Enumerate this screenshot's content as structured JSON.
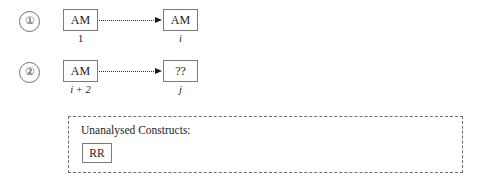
{
  "diagram": {
    "rows": [
      {
        "marker": "①",
        "source": {
          "text": "AM",
          "label": "1"
        },
        "target": {
          "text": "AM",
          "label": "i"
        }
      },
      {
        "marker": "②",
        "source": {
          "text": "AM",
          "label": "i + 2"
        },
        "target": {
          "text": "??",
          "label": "j"
        }
      }
    ],
    "panel": {
      "title": "Unanalysed Constructs:",
      "items": [
        {
          "text": "RR"
        }
      ]
    },
    "colors": {
      "box_border": "#7b7b7b",
      "connector": "#2a2a2a",
      "panel_border": "#6d6d6d",
      "text": "#1c1c1c",
      "background": "#ffffff"
    }
  }
}
